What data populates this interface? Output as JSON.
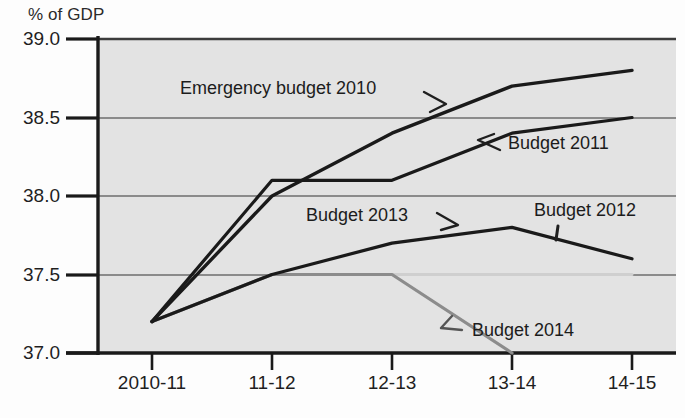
{
  "chart_data": {
    "type": "line",
    "title": "",
    "ylabel": "% of GDP",
    "xlabel": "",
    "categories": [
      "2010-11",
      "11-12",
      "12-13",
      "13-14",
      "14-15"
    ],
    "ylim": [
      37.0,
      39.0
    ],
    "yticks": [
      "39.0",
      "38.5",
      "38.0",
      "37.5",
      "37.0"
    ],
    "ytick_values": [
      39.0,
      38.5,
      38.0,
      37.5,
      37.0
    ],
    "grid": true,
    "legend_position": "inline-annotations",
    "series": [
      {
        "name": "Emergency budget 2010",
        "color": "#1a1a1a",
        "values": [
          37.2,
          38.0,
          38.4,
          38.7,
          38.8
        ]
      },
      {
        "name": "Budget 2011",
        "color": "#1a1a1a",
        "values": [
          37.2,
          38.1,
          38.1,
          38.4,
          38.5
        ]
      },
      {
        "name": "Budget 2012",
        "color": "#cfcfcf",
        "values": [
          37.2,
          37.5,
          37.5,
          37.5,
          37.5
        ]
      },
      {
        "name": "Budget 2013",
        "color": "#1a1a1a",
        "values": [
          37.2,
          37.5,
          37.7,
          37.8,
          37.6
        ]
      },
      {
        "name": "Budget 2014",
        "color": "#8c8c8c",
        "values": [
          37.2,
          37.5,
          37.5,
          37.0,
          null
        ]
      }
    ],
    "annotations": [
      {
        "text": "Emergency budget 2010",
        "series": "Emergency budget 2010"
      },
      {
        "text": "Budget 2011",
        "series": "Budget 2011"
      },
      {
        "text": "Budget 2012",
        "series": "Budget 2012"
      },
      {
        "text": "Budget 2013",
        "series": "Budget 2013"
      },
      {
        "text": "Budget 2014",
        "series": "Budget 2014"
      }
    ]
  },
  "axes": {
    "y_title": "% of GDP",
    "y_labels": [
      "39.0",
      "38.5",
      "38.0",
      "37.5",
      "37.0"
    ],
    "x_labels": [
      "2010-11",
      "11-12",
      "12-13",
      "13-14",
      "14-15"
    ]
  },
  "annotations": {
    "emergency_budget_2010": "Emergency budget 2010",
    "budget_2011": "Budget 2011",
    "budget_2012": "Budget 2012",
    "budget_2013": "Budget 2013",
    "budget_2014": "Budget 2014"
  },
  "colors": {
    "plot_background": "#e3e3e3",
    "page_background": "#fdfdfd",
    "axis": "#1a1a1a",
    "gridline": "#6e6e6e",
    "series_dark": "#1a1a1a",
    "series_grey": "#8c8c8c",
    "series_light": "#cfcfcf"
  }
}
